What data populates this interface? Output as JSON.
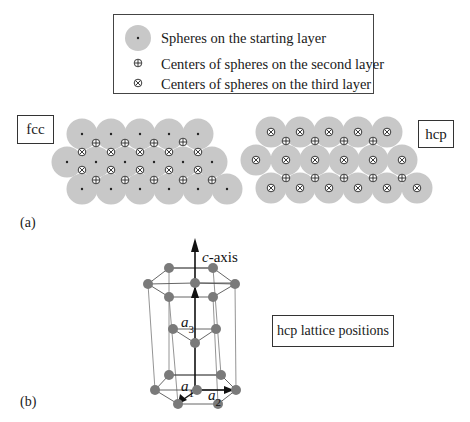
{
  "legend": {
    "items": [
      {
        "symbol": "sphere-dot",
        "label": "Spheres on the starting layer"
      },
      {
        "symbol": "circle-plus",
        "label": "Centers of spheres on the second layer"
      },
      {
        "symbol": "circle-x",
        "label": "Centers of spheres on the third layer"
      }
    ]
  },
  "panel_a": {
    "label": "(a)",
    "fcc": {
      "title": "fcc",
      "rows": [
        {
          "y": 134,
          "x": [
            82,
            111,
            140,
            169,
            198
          ]
        },
        {
          "y": 162,
          "x": [
            67,
            96,
            125,
            154,
            183,
            212
          ]
        },
        {
          "y": 189,
          "x": [
            82,
            111,
            140,
            169,
            198,
            227
          ]
        }
      ],
      "second_layer": [
        [
          96,
          143
        ],
        [
          125,
          143
        ],
        [
          154,
          143
        ],
        [
          183,
          142
        ],
        [
          96,
          180
        ],
        [
          125,
          180
        ],
        [
          154,
          180
        ],
        [
          183,
          180
        ],
        [
          212,
          180
        ]
      ],
      "third_layer": [
        [
          82,
          152
        ],
        [
          111,
          152
        ],
        [
          140,
          152
        ],
        [
          169,
          152
        ],
        [
          198,
          152
        ],
        [
          82,
          170
        ],
        [
          111,
          170
        ],
        [
          140,
          170
        ],
        [
          169,
          170
        ],
        [
          198,
          170
        ]
      ]
    },
    "hcp": {
      "title": "hcp",
      "rows": [
        {
          "y": 132,
          "x": [
            271,
            300,
            329,
            358,
            387
          ]
        },
        {
          "y": 160,
          "x": [
            256,
            286,
            315,
            344,
            373,
            402
          ]
        },
        {
          "y": 188,
          "x": [
            271,
            300,
            329,
            358,
            387,
            417
          ]
        }
      ],
      "second_layer": [
        [
          286,
          141
        ],
        [
          315,
          141
        ],
        [
          344,
          141
        ],
        [
          373,
          141
        ],
        [
          286,
          178
        ],
        [
          315,
          178
        ],
        [
          344,
          178
        ],
        [
          373,
          178
        ],
        [
          402,
          178
        ]
      ]
    }
  },
  "panel_b": {
    "label": "(b)",
    "caption": "hcp lattice positions",
    "axis_label_c": "c-axis",
    "vector_labels": {
      "a1": "a",
      "a1_sub": "1",
      "a2": "a",
      "a2_sub": "2",
      "a3": "a",
      "a3_sub": "3"
    },
    "top_hex": [
      [
        169,
        268
      ],
      [
        213,
        268
      ],
      [
        235,
        284
      ],
      [
        213,
        297
      ],
      [
        169,
        297
      ],
      [
        148,
        284
      ]
    ],
    "top_center": [
      195,
      283
    ],
    "mid": [
      [
        173,
        329
      ],
      [
        216,
        329
      ],
      [
        195,
        343
      ]
    ],
    "bottom_hex": [
      [
        169,
        375
      ],
      [
        221,
        375
      ],
      [
        236,
        390
      ],
      [
        218,
        404
      ],
      [
        178,
        404
      ],
      [
        155,
        390
      ]
    ],
    "bottom_center": [
      197,
      390
    ],
    "colors": {
      "atom": "#7a7a7a",
      "bond": "#555555",
      "sphere": "#c8c8c8"
    }
  }
}
